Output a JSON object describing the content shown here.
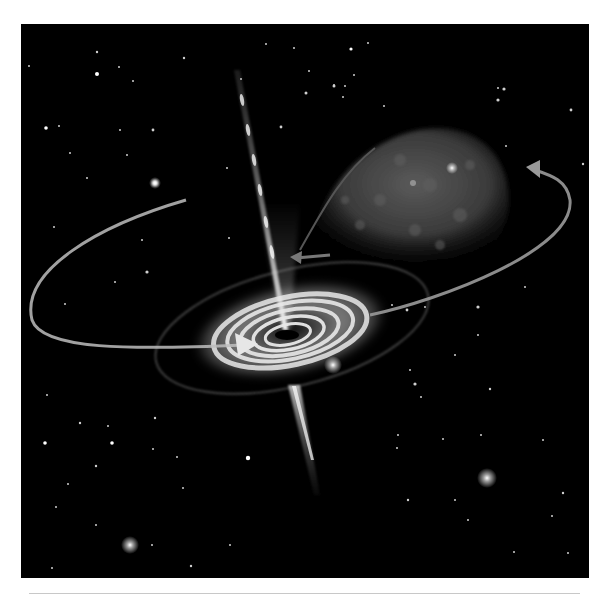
{
  "illustration": {
    "subject": "black hole accretion disk with relativistic jets and companion star",
    "colors": {
      "background": "#000000",
      "page": "#ffffff",
      "rule": "#c8c8c8",
      "disk_light": "#e6e6e6",
      "star_glow": "#ffffff"
    },
    "elements": [
      "accretion-disk",
      "upper-jet",
      "lower-jet",
      "companion-star",
      "mass-transfer-stream",
      "orbit-arrow-left",
      "orbit-arrow-right",
      "star-field"
    ]
  }
}
